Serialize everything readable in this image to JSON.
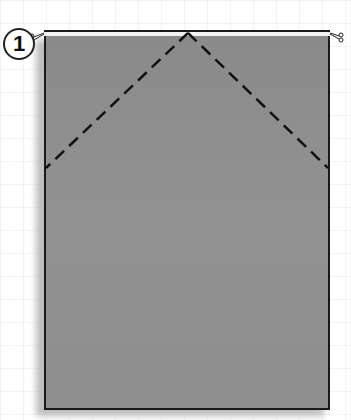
{
  "diagram": {
    "step_number": "1",
    "paper": {
      "color": "#8e8e8e",
      "edge_color": "#1a1a1a"
    },
    "fold_lines": [
      {
        "style": "dashed",
        "type": "valley-fold",
        "from": [
          188,
          32
        ],
        "to": [
          46,
          168
        ]
      },
      {
        "style": "dashed",
        "type": "valley-fold",
        "from": [
          188,
          32
        ],
        "to": [
          328,
          168
        ]
      }
    ],
    "markers": [
      "cut-mark-top-left",
      "cut-mark-top-right"
    ]
  }
}
